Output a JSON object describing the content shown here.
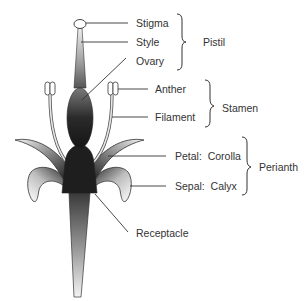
{
  "diagram": {
    "type": "labeled-flower-anatomy",
    "colors": {
      "background": "#ffffff",
      "ink": "#333333",
      "dark_fill": "#1e1e1e",
      "gradient_light": "#f2f2f2"
    },
    "parts": [
      {
        "id": "stigma",
        "label": "Stigma"
      },
      {
        "id": "style",
        "label": "Style"
      },
      {
        "id": "ovary",
        "label": "Ovary"
      },
      {
        "id": "anther",
        "label": "Anther"
      },
      {
        "id": "filament",
        "label": "Filament"
      },
      {
        "id": "petal",
        "label": "Petal:  Corolla"
      },
      {
        "id": "sepal",
        "label": "Sepal:  Calyx"
      },
      {
        "id": "receptacle",
        "label": "Receptacle"
      }
    ],
    "groups": [
      {
        "id": "pistil",
        "label": "Pistil",
        "members": [
          "Stigma",
          "Style",
          "Ovary"
        ]
      },
      {
        "id": "stamen",
        "label": "Stamen",
        "members": [
          "Anther",
          "Filament"
        ]
      },
      {
        "id": "perianth",
        "label": "Perianth",
        "members": [
          "Petal: Corolla",
          "Sepal: Calyx"
        ]
      }
    ]
  }
}
